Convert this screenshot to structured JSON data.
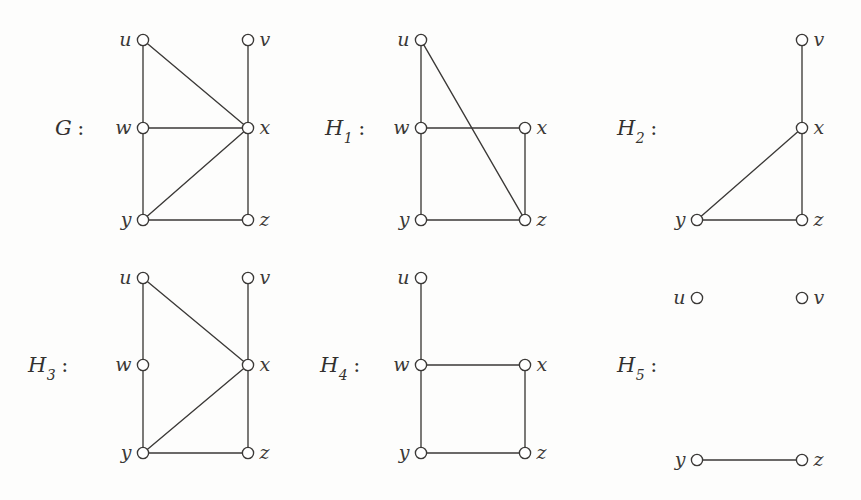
{
  "figure": {
    "background_color": "#fdfdfc",
    "ink_color": "#3b3937",
    "node_fill": "#ffffff",
    "node_radius": 5.6,
    "width": 861,
    "height": 500
  },
  "graphs": [
    {
      "id": "G",
      "label": "G",
      "subscript": "",
      "colon": ":",
      "label_x": 55,
      "label_y": 116,
      "vertices": [
        {
          "name": "u",
          "x": 143,
          "y": 40,
          "label_side": "left"
        },
        {
          "name": "v",
          "x": 248,
          "y": 40,
          "label_side": "right"
        },
        {
          "name": "w",
          "x": 143,
          "y": 128,
          "label_side": "left"
        },
        {
          "name": "x",
          "x": 248,
          "y": 128,
          "label_side": "right"
        },
        {
          "name": "y",
          "x": 143,
          "y": 220,
          "label_side": "left"
        },
        {
          "name": "z",
          "x": 248,
          "y": 220,
          "label_side": "right"
        }
      ],
      "edges": [
        [
          "u",
          "w"
        ],
        [
          "u",
          "x"
        ],
        [
          "v",
          "x"
        ],
        [
          "w",
          "x"
        ],
        [
          "w",
          "y"
        ],
        [
          "x",
          "y"
        ],
        [
          "x",
          "z"
        ],
        [
          "y",
          "z"
        ]
      ]
    },
    {
      "id": "H1",
      "label": "H",
      "subscript": "1",
      "colon": ":",
      "label_x": 325,
      "label_y": 116,
      "vertices": [
        {
          "name": "u",
          "x": 421,
          "y": 40,
          "label_side": "left"
        },
        {
          "name": "w",
          "x": 421,
          "y": 128,
          "label_side": "left"
        },
        {
          "name": "x",
          "x": 525,
          "y": 128,
          "label_side": "right"
        },
        {
          "name": "y",
          "x": 421,
          "y": 220,
          "label_side": "left"
        },
        {
          "name": "z",
          "x": 525,
          "y": 220,
          "label_side": "right"
        }
      ],
      "edges": [
        [
          "u",
          "w"
        ],
        [
          "u",
          "z"
        ],
        [
          "w",
          "x"
        ],
        [
          "w",
          "y"
        ],
        [
          "x",
          "z"
        ],
        [
          "y",
          "z"
        ]
      ]
    },
    {
      "id": "H2",
      "label": "H",
      "subscript": "2",
      "colon": ":",
      "label_x": 617,
      "label_y": 116,
      "vertices": [
        {
          "name": "v",
          "x": 802,
          "y": 40,
          "label_side": "right"
        },
        {
          "name": "x",
          "x": 802,
          "y": 128,
          "label_side": "right"
        },
        {
          "name": "y",
          "x": 697,
          "y": 220,
          "label_side": "left"
        },
        {
          "name": "z",
          "x": 802,
          "y": 220,
          "label_side": "right"
        }
      ],
      "edges": [
        [
          "v",
          "x"
        ],
        [
          "x",
          "y"
        ],
        [
          "x",
          "z"
        ],
        [
          "y",
          "z"
        ]
      ]
    },
    {
      "id": "H3",
      "label": "H",
      "subscript": "3",
      "colon": ":",
      "label_x": 28,
      "label_y": 353,
      "vertices": [
        {
          "name": "u",
          "x": 143,
          "y": 278,
          "label_side": "left"
        },
        {
          "name": "v",
          "x": 248,
          "y": 278,
          "label_side": "right"
        },
        {
          "name": "w",
          "x": 143,
          "y": 365,
          "label_side": "left"
        },
        {
          "name": "x",
          "x": 248,
          "y": 365,
          "label_side": "right"
        },
        {
          "name": "y",
          "x": 143,
          "y": 453,
          "label_side": "left"
        },
        {
          "name": "z",
          "x": 248,
          "y": 453,
          "label_side": "right"
        }
      ],
      "edges": [
        [
          "u",
          "w"
        ],
        [
          "u",
          "x"
        ],
        [
          "v",
          "x"
        ],
        [
          "w",
          "y"
        ],
        [
          "x",
          "y"
        ],
        [
          "x",
          "z"
        ],
        [
          "y",
          "z"
        ]
      ]
    },
    {
      "id": "H4",
      "label": "H",
      "subscript": "4",
      "colon": ":",
      "label_x": 320,
      "label_y": 353,
      "vertices": [
        {
          "name": "u",
          "x": 421,
          "y": 278,
          "label_side": "left"
        },
        {
          "name": "w",
          "x": 421,
          "y": 365,
          "label_side": "left"
        },
        {
          "name": "x",
          "x": 525,
          "y": 365,
          "label_side": "right"
        },
        {
          "name": "y",
          "x": 421,
          "y": 453,
          "label_side": "left"
        },
        {
          "name": "z",
          "x": 525,
          "y": 453,
          "label_side": "right"
        }
      ],
      "edges": [
        [
          "u",
          "w"
        ],
        [
          "w",
          "x"
        ],
        [
          "w",
          "y"
        ],
        [
          "x",
          "z"
        ],
        [
          "y",
          "z"
        ]
      ]
    },
    {
      "id": "H5",
      "label": "H",
      "subscript": "5",
      "colon": ":",
      "label_x": 617,
      "label_y": 353,
      "vertices": [
        {
          "name": "u",
          "x": 697,
          "y": 298,
          "label_side": "left"
        },
        {
          "name": "v",
          "x": 802,
          "y": 298,
          "label_side": "right"
        },
        {
          "name": "y",
          "x": 697,
          "y": 460,
          "label_side": "left"
        },
        {
          "name": "z",
          "x": 802,
          "y": 460,
          "label_side": "right"
        }
      ],
      "edges": [
        [
          "y",
          "z"
        ]
      ]
    }
  ]
}
